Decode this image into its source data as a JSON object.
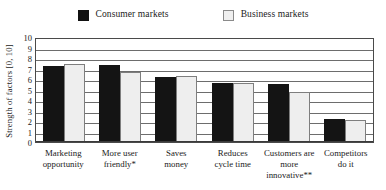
{
  "chart_data": {
    "type": "bar",
    "title": "",
    "xlabel": "",
    "ylabel": "Strength of  factors [0, 10]",
    "ylim": [
      0,
      10
    ],
    "yticks": [
      10,
      9,
      8,
      7,
      6,
      5,
      4,
      3,
      2,
      1,
      0
    ],
    "grid": true,
    "legend_position": "top-center",
    "categories": [
      "Marketing opportunity",
      "More user friendly*",
      "Saves money",
      "Reduces cycle time",
      "Customers are more innovative**",
      "Competitors do it"
    ],
    "category_lines": [
      [
        "Marketing",
        "opportunity"
      ],
      [
        "More user",
        "friendly*"
      ],
      [
        "Saves",
        "money"
      ],
      [
        "Reduces",
        "cycle time"
      ],
      [
        "Customers are",
        "more innovative**"
      ],
      [
        "Competitors",
        "do it"
      ]
    ],
    "series": [
      {
        "name": "Consumer markets",
        "color": "#141414",
        "values": [
          7.2,
          7.3,
          6.2,
          5.6,
          5.5,
          2.2
        ]
      },
      {
        "name": "Business markets",
        "color": "#eeeeee",
        "values": [
          7.4,
          6.7,
          6.3,
          5.6,
          4.8,
          2.1
        ]
      }
    ]
  },
  "legend": {
    "entries": [
      {
        "label": "Consumer markets",
        "swatch": "consumer"
      },
      {
        "label": "Business markets",
        "swatch": "business"
      }
    ]
  },
  "colors": {
    "consumer": "#141414",
    "business": "#eeeeee",
    "grid": "#6d6d6d",
    "axis": "#3a3a3a",
    "background": "#ffffff"
  }
}
